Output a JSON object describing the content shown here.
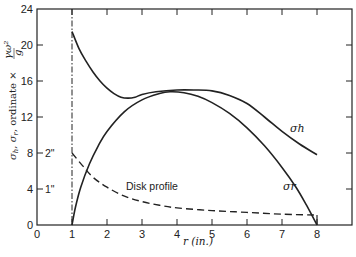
{
  "chart_data": {
    "type": "line",
    "title": "",
    "xlabel": "r (in.)",
    "ylabel": "σh, σr, ordinate × γω²/g",
    "xlim": [
      0,
      9
    ],
    "ylim": [
      0,
      24
    ],
    "grid": false,
    "x_ticks": [
      0,
      1,
      2,
      3,
      4,
      5,
      6,
      7,
      8
    ],
    "y_ticks": [
      0,
      4,
      8,
      12,
      16,
      20,
      24
    ],
    "y_secondary_labels": [
      {
        "y": 8,
        "label": "2\""
      },
      {
        "y": 4,
        "label": "1\""
      }
    ],
    "vertical_reference_line": {
      "x": 1,
      "style": "dash-dot"
    },
    "series": [
      {
        "name": "σh",
        "style": "solid",
        "points": [
          [
            1.0,
            21.5
          ],
          [
            1.2,
            19.6
          ],
          [
            1.4,
            18.2
          ],
          [
            1.6,
            17.0
          ],
          [
            1.8,
            16.0
          ],
          [
            2.0,
            15.2
          ],
          [
            2.2,
            14.6
          ],
          [
            2.4,
            14.2
          ],
          [
            2.6,
            14.1
          ],
          [
            2.8,
            14.2
          ],
          [
            3.0,
            14.5
          ],
          [
            3.4,
            14.8
          ],
          [
            4.0,
            15.0
          ],
          [
            4.5,
            15.0
          ],
          [
            5.0,
            14.9
          ],
          [
            5.5,
            14.4
          ],
          [
            6.0,
            13.5
          ],
          [
            6.5,
            12.0
          ],
          [
            7.0,
            10.4
          ],
          [
            7.5,
            9.0
          ],
          [
            8.0,
            7.8
          ]
        ]
      },
      {
        "name": "σr",
        "style": "solid",
        "points": [
          [
            1.0,
            0.0
          ],
          [
            1.1,
            2.0
          ],
          [
            1.25,
            4.2
          ],
          [
            1.5,
            6.8
          ],
          [
            1.75,
            8.8
          ],
          [
            2.0,
            10.4
          ],
          [
            2.5,
            12.6
          ],
          [
            3.0,
            13.9
          ],
          [
            3.5,
            14.6
          ],
          [
            3.8,
            14.8
          ],
          [
            4.2,
            14.7
          ],
          [
            4.6,
            14.3
          ],
          [
            5.0,
            13.6
          ],
          [
            5.5,
            12.4
          ],
          [
            6.0,
            10.8
          ],
          [
            6.5,
            8.8
          ],
          [
            7.0,
            6.4
          ],
          [
            7.4,
            4.2
          ],
          [
            7.7,
            2.2
          ],
          [
            8.0,
            0.0
          ]
        ]
      },
      {
        "name": "Disk profile",
        "style": "dashed",
        "points": [
          [
            1.0,
            8.0
          ],
          [
            1.3,
            6.6
          ],
          [
            1.6,
            5.3
          ],
          [
            2.0,
            4.2
          ],
          [
            2.5,
            3.2
          ],
          [
            3.0,
            2.6
          ],
          [
            3.5,
            2.2
          ],
          [
            4.0,
            1.9
          ],
          [
            5.0,
            1.6
          ],
          [
            6.0,
            1.4
          ],
          [
            7.0,
            1.2
          ],
          [
            8.0,
            1.1
          ]
        ]
      }
    ],
    "annotations": [
      {
        "text": "σh",
        "x": 7.3,
        "y": 10.2
      },
      {
        "text": "σr",
        "x": 7.1,
        "y": 5.0
      },
      {
        "text": "Disk profile",
        "x": 2.35,
        "y": 4.3
      }
    ]
  },
  "labels": {
    "xlabel": "r (in.)",
    "sigma_h": "σh",
    "sigma_r": "σr",
    "disk_profile": "Disk profile",
    "y2_2in": "2\"",
    "y2_1in": "1\""
  }
}
